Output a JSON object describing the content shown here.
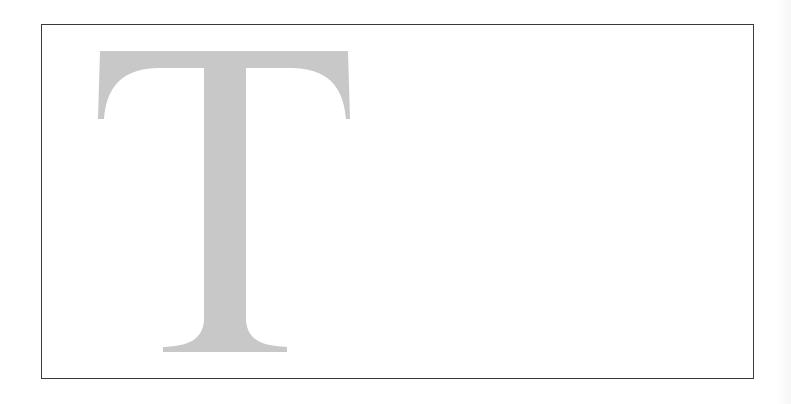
{
  "specimen": {
    "letter": "T",
    "letter_color": "#c8c8c8",
    "frame_color": "#3a3a3a",
    "background": "#ffffff"
  }
}
